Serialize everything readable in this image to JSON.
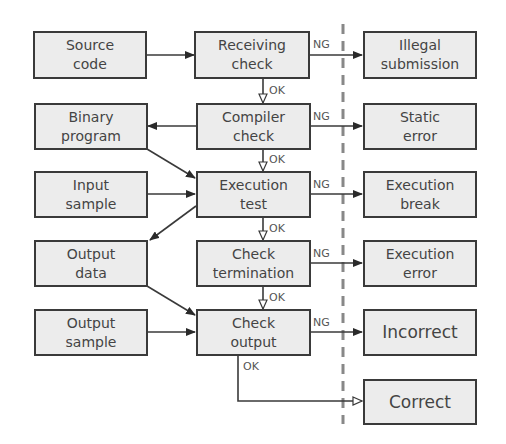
{
  "diagram": {
    "divider": "dashed vertical separator",
    "inputs": [
      {
        "id": "source_code",
        "lines": [
          "Source",
          "code"
        ]
      },
      {
        "id": "binary_program",
        "lines": [
          "Binary",
          "program"
        ]
      },
      {
        "id": "input_sample",
        "lines": [
          "Input",
          "sample"
        ]
      },
      {
        "id": "output_data",
        "lines": [
          "Output",
          "data"
        ]
      },
      {
        "id": "output_sample",
        "lines": [
          "Output",
          "sample"
        ]
      }
    ],
    "steps": [
      {
        "id": "receiving_check",
        "lines": [
          "Receiving",
          "check"
        ]
      },
      {
        "id": "compiler_check",
        "lines": [
          "Compiler",
          "check"
        ]
      },
      {
        "id": "execution_test",
        "lines": [
          "Execution",
          "test"
        ]
      },
      {
        "id": "check_termination",
        "lines": [
          "Check",
          "termination"
        ]
      },
      {
        "id": "check_output",
        "lines": [
          "Check",
          "output"
        ]
      }
    ],
    "results": [
      {
        "id": "illegal_submission",
        "lines": [
          "Illegal",
          "submission"
        ]
      },
      {
        "id": "static_error",
        "lines": [
          "Static",
          "error"
        ]
      },
      {
        "id": "execution_break",
        "lines": [
          "Execution",
          "break"
        ]
      },
      {
        "id": "execution_error",
        "lines": [
          "Execution",
          "error"
        ]
      },
      {
        "id": "incorrect",
        "lines": [
          "Incorrect"
        ]
      },
      {
        "id": "correct",
        "lines": [
          "Correct"
        ]
      }
    ],
    "edge_labels": {
      "ng": "NG",
      "ok": "OK"
    },
    "colors": {
      "box_fill": "#ececec",
      "box_border": "#3a3a3a",
      "text": "#444444",
      "line": "#3a3a3a",
      "divider": "#888888"
    }
  }
}
